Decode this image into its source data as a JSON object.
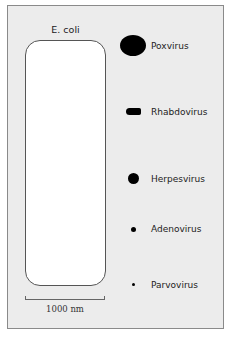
{
  "figure": {
    "reference": {
      "label": "E. coli",
      "scale_bar_label": "1000 nm"
    },
    "viruses": [
      {
        "name": "Poxvirus",
        "shape": "large oval"
      },
      {
        "name": "Rhabdovirus",
        "shape": "bullet"
      },
      {
        "name": "Herpesvirus",
        "shape": "medium circle"
      },
      {
        "name": "Adenovirus",
        "shape": "small circle"
      },
      {
        "name": "Parvovirus",
        "shape": "tiny dot"
      }
    ],
    "colors": {
      "background": "#ececec",
      "bacterium_fill": "#ffffff",
      "outline": "#555555",
      "virus_fill": "#000000"
    }
  }
}
